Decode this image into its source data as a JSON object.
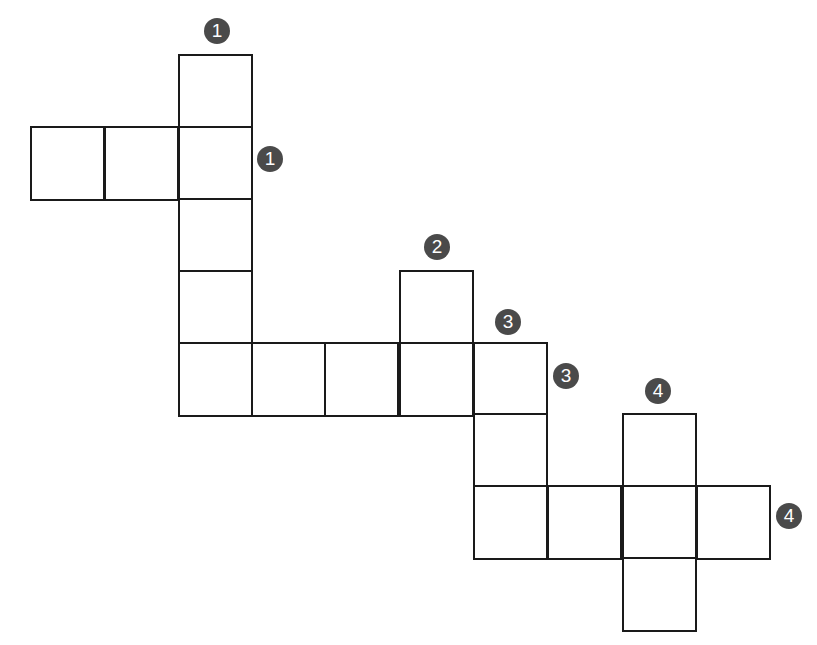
{
  "puzzle": {
    "type": "crossword-grid",
    "cell_size_px": 73,
    "cells": [
      {
        "x": 178,
        "y": 54
      },
      {
        "x": 30,
        "y": 126
      },
      {
        "x": 104,
        "y": 126
      },
      {
        "x": 178,
        "y": 126
      },
      {
        "x": 178,
        "y": 198
      },
      {
        "x": 178,
        "y": 270
      },
      {
        "x": 399,
        "y": 270
      },
      {
        "x": 178,
        "y": 342
      },
      {
        "x": 251,
        "y": 342
      },
      {
        "x": 324,
        "y": 342
      },
      {
        "x": 399,
        "y": 342
      },
      {
        "x": 473,
        "y": 342
      },
      {
        "x": 473,
        "y": 413
      },
      {
        "x": 622,
        "y": 413
      },
      {
        "x": 473,
        "y": 485
      },
      {
        "x": 547,
        "y": 485
      },
      {
        "x": 622,
        "y": 485
      },
      {
        "x": 696,
        "y": 485
      },
      {
        "x": 622,
        "y": 557
      }
    ],
    "clue_numbers": [
      {
        "label": "1",
        "direction": "down",
        "x": 204,
        "y": 18
      },
      {
        "label": "1",
        "direction": "across",
        "x": 257,
        "y": 146
      },
      {
        "label": "2",
        "direction": "down",
        "x": 424,
        "y": 234
      },
      {
        "label": "3",
        "direction": "down",
        "x": 495,
        "y": 309
      },
      {
        "label": "3",
        "direction": "across",
        "x": 553,
        "y": 363
      },
      {
        "label": "4",
        "direction": "down",
        "x": 645,
        "y": 378
      },
      {
        "label": "4",
        "direction": "across",
        "x": 776,
        "y": 503
      }
    ]
  }
}
